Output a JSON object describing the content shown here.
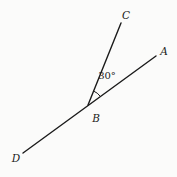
{
  "figure": {
    "background": "#fbfbfa",
    "stroke_color": "#1b1b1b",
    "stroke_width": 1.4,
    "arc_stroke_width": 1,
    "points": {
      "A": {
        "x": 156,
        "y": 56
      },
      "B": {
        "x": 88,
        "y": 105
      },
      "C": {
        "x": 121,
        "y": 23
      },
      "D": {
        "x": 23,
        "y": 153
      }
    },
    "segments": [
      [
        "D",
        "A"
      ],
      [
        "B",
        "C"
      ]
    ],
    "angle_arc": {
      "vertex": "B",
      "from": "C",
      "to": "A",
      "radius": 15
    },
    "labels": [
      {
        "name": "point-C",
        "text": "C",
        "x": 126,
        "y": 15,
        "style": "italic"
      },
      {
        "name": "point-A",
        "text": "A",
        "x": 164,
        "y": 51,
        "style": "italic"
      },
      {
        "name": "point-B",
        "text": "B",
        "x": 96,
        "y": 118,
        "style": "italic"
      },
      {
        "name": "point-D",
        "text": "D",
        "x": 16,
        "y": 158,
        "style": "italic"
      },
      {
        "name": "angle-measure",
        "text": "30°",
        "x": 107,
        "y": 76,
        "style": "normal"
      }
    ]
  }
}
